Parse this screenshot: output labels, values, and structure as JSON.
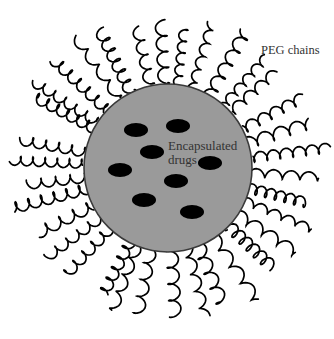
{
  "labels": {
    "peg_chains": "PEG chains",
    "encapsulated_drugs_line1": "Encapsulated",
    "encapsulated_drugs_line2": "drugs"
  },
  "particle": {
    "center": [
      168,
      168
    ],
    "radius": 84,
    "fill": "#9a9a9a",
    "stroke": "#3a3a3a"
  },
  "drugs": {
    "fill": "#000000",
    "rx": 12,
    "ry": 7,
    "positions": [
      [
        136,
        130
      ],
      [
        178,
        126
      ],
      [
        152,
        152
      ],
      [
        120,
        170
      ],
      [
        210,
        163
      ],
      [
        176,
        181
      ],
      [
        144,
        200
      ],
      [
        192,
        212
      ]
    ]
  },
  "peg": {
    "count": 34,
    "inner_radius": 84,
    "outer_radius": 152,
    "stroke": "#000000"
  }
}
